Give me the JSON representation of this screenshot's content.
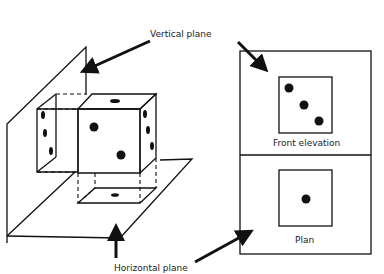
{
  "diagram": {
    "labels": {
      "vertical_plane": "Vertical plane",
      "horizontal_plane": "Horizontal plane",
      "front_elevation": "Front elevation",
      "plan": "Plan"
    },
    "views": [
      {
        "name": "Front elevation",
        "pips": 3
      },
      {
        "name": "Plan",
        "pips": 1
      }
    ],
    "colors": {
      "line": "#111111",
      "background": "#ffffff"
    }
  }
}
